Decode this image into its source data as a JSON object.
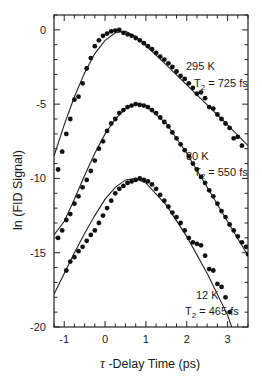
{
  "chart_data": {
    "type": "scatter",
    "title": "",
    "xlabel": "τ -Delay Time (ps)",
    "ylabel": "ln (FID Signal)",
    "xlim": [
      -1.25,
      3.5
    ],
    "ylim": [
      -20,
      1
    ],
    "xticks": [
      -1,
      0,
      1,
      2,
      3
    ],
    "yticks": [
      0,
      -5,
      -10,
      -15,
      -20
    ],
    "grid": false,
    "legend": "none",
    "series": [
      {
        "name": "295 K",
        "annotation": "295 K",
        "t2_label": "T2 = 725 fs",
        "t2_fs": 725,
        "offset": 0,
        "points": [
          [
            -1.15,
            -9.4
          ],
          [
            -1.05,
            -8.2
          ],
          [
            -0.95,
            -7.0
          ],
          [
            -0.85,
            -6.0
          ],
          [
            -0.75,
            -4.7
          ],
          [
            -0.65,
            -4.5
          ],
          [
            -0.55,
            -3.6
          ],
          [
            -0.45,
            -2.6
          ],
          [
            -0.35,
            -1.9
          ],
          [
            -0.25,
            -1.1
          ],
          [
            -0.15,
            -0.7
          ],
          [
            -0.05,
            -0.4
          ],
          [
            0.05,
            -0.25
          ],
          [
            0.15,
            -0.1
          ],
          [
            0.25,
            -0.05
          ],
          [
            0.35,
            0.0
          ],
          [
            0.45,
            -0.2
          ],
          [
            0.55,
            -0.3
          ],
          [
            0.65,
            -0.4
          ],
          [
            0.75,
            -0.55
          ],
          [
            0.85,
            -0.7
          ],
          [
            0.95,
            -0.9
          ],
          [
            1.05,
            -1.1
          ],
          [
            1.15,
            -1.3
          ],
          [
            1.25,
            -1.55
          ],
          [
            1.35,
            -1.8
          ],
          [
            1.45,
            -2.0
          ],
          [
            1.55,
            -2.25
          ],
          [
            1.65,
            -2.5
          ],
          [
            1.75,
            -2.8
          ],
          [
            1.85,
            -3.1
          ],
          [
            1.95,
            -3.3
          ],
          [
            2.05,
            -3.6
          ],
          [
            2.15,
            -3.9
          ],
          [
            2.25,
            -4.3
          ],
          [
            2.35,
            -4.2
          ],
          [
            2.45,
            -4.6
          ],
          [
            2.55,
            -5.2
          ],
          [
            2.65,
            -5.3
          ],
          [
            2.75,
            -5.7
          ],
          [
            2.85,
            -6.0
          ],
          [
            2.95,
            -6.3
          ],
          [
            3.05,
            -6.6
          ],
          [
            3.15,
            -7.3
          ],
          [
            3.25,
            -7.2
          ],
          [
            3.35,
            -7.8
          ]
        ],
        "fit": [
          [
            -1.25,
            -8.5
          ],
          [
            -1.0,
            -6.4
          ],
          [
            -0.75,
            -4.5
          ],
          [
            -0.5,
            -2.9
          ],
          [
            -0.25,
            -1.6
          ],
          [
            0.0,
            -0.7
          ],
          [
            0.25,
            -0.2
          ],
          [
            0.5,
            -0.1
          ],
          [
            0.75,
            -0.45
          ],
          [
            1.0,
            -1.05
          ],
          [
            1.5,
            -2.35
          ],
          [
            2.0,
            -3.7
          ],
          [
            2.5,
            -5.05
          ],
          [
            3.0,
            -6.4
          ],
          [
            3.5,
            -7.8
          ]
        ]
      },
      {
        "name": "80 K",
        "annotation": "80 K",
        "t2_label": "T2 = 550 fs",
        "t2_fs": 550,
        "offset": -5,
        "points": [
          [
            -1.15,
            -14.0
          ],
          [
            -1.05,
            -13.5
          ],
          [
            -0.95,
            -12.8
          ],
          [
            -0.85,
            -12.4
          ],
          [
            -0.75,
            -11.7
          ],
          [
            -0.65,
            -11.2
          ],
          [
            -0.55,
            -10.6
          ],
          [
            -0.45,
            -10.1
          ],
          [
            -0.35,
            -9.5
          ],
          [
            -0.25,
            -8.8
          ],
          [
            -0.15,
            -8.0
          ],
          [
            -0.05,
            -7.5
          ],
          [
            0.05,
            -6.8
          ],
          [
            0.15,
            -6.3
          ],
          [
            0.25,
            -6.0
          ],
          [
            0.35,
            -5.6
          ],
          [
            0.45,
            -5.4
          ],
          [
            0.55,
            -5.2
          ],
          [
            0.65,
            -5.1
          ],
          [
            0.75,
            -5.0
          ],
          [
            0.85,
            -5.05
          ],
          [
            0.95,
            -5.1
          ],
          [
            1.05,
            -5.2
          ],
          [
            1.15,
            -5.4
          ],
          [
            1.25,
            -5.6
          ],
          [
            1.35,
            -5.9
          ],
          [
            1.45,
            -6.2
          ],
          [
            1.55,
            -6.5
          ],
          [
            1.65,
            -6.9
          ],
          [
            1.75,
            -7.3
          ],
          [
            1.85,
            -7.7
          ],
          [
            1.95,
            -8.1
          ],
          [
            2.05,
            -8.5
          ],
          [
            2.15,
            -9.0
          ],
          [
            2.25,
            -9.4
          ],
          [
            2.35,
            -9.9
          ],
          [
            2.45,
            -10.3
          ],
          [
            2.55,
            -10.8
          ],
          [
            2.65,
            -11.2
          ],
          [
            2.75,
            -11.7
          ],
          [
            2.85,
            -12.2
          ],
          [
            2.95,
            -12.6
          ],
          [
            3.05,
            -13.1
          ],
          [
            3.15,
            -13.5
          ],
          [
            3.25,
            -13.9
          ],
          [
            3.35,
            -14.3
          ],
          [
            3.45,
            -14.6
          ],
          [
            3.5,
            -15.1
          ]
        ],
        "fit": [
          [
            -1.25,
            -13.8
          ],
          [
            -1.0,
            -12.9
          ],
          [
            -0.75,
            -11.4
          ],
          [
            -0.5,
            -9.8
          ],
          [
            -0.25,
            -8.3
          ],
          [
            0.0,
            -7.0
          ],
          [
            0.25,
            -6.0
          ],
          [
            0.5,
            -5.3
          ],
          [
            0.75,
            -5.0
          ],
          [
            1.0,
            -5.1
          ],
          [
            1.5,
            -6.3
          ],
          [
            2.0,
            -8.3
          ],
          [
            2.5,
            -10.6
          ],
          [
            3.0,
            -12.9
          ],
          [
            3.5,
            -15.2
          ]
        ]
      },
      {
        "name": "12 K",
        "annotation": "12 K",
        "t2_label": "T2 = 465 fs",
        "t2_fs": 465,
        "offset": -10,
        "points": [
          [
            -0.95,
            -16.2
          ],
          [
            -0.85,
            -15.6
          ],
          [
            -0.75,
            -15.3
          ],
          [
            -0.65,
            -14.9
          ],
          [
            -0.55,
            -14.6
          ],
          [
            -0.45,
            -14.2
          ],
          [
            -0.35,
            -13.8
          ],
          [
            -0.25,
            -13.5
          ],
          [
            -0.15,
            -13.0
          ],
          [
            -0.05,
            -12.5
          ],
          [
            0.05,
            -12.0
          ],
          [
            0.15,
            -11.5
          ],
          [
            0.25,
            -11.0
          ],
          [
            0.35,
            -10.7
          ],
          [
            0.45,
            -10.5
          ],
          [
            0.55,
            -10.3
          ],
          [
            0.65,
            -10.2
          ],
          [
            0.75,
            -10.1
          ],
          [
            0.85,
            -10.0
          ],
          [
            0.95,
            -10.1
          ],
          [
            1.05,
            -10.2
          ],
          [
            1.15,
            -10.4
          ],
          [
            1.25,
            -10.7
          ],
          [
            1.35,
            -11.1
          ],
          [
            1.45,
            -11.5
          ],
          [
            1.55,
            -11.9
          ],
          [
            1.65,
            -12.3
          ],
          [
            1.75,
            -12.6
          ],
          [
            1.85,
            -13.0
          ],
          [
            1.95,
            -13.5
          ],
          [
            2.05,
            -14.0
          ],
          [
            2.15,
            -14.3
          ],
          [
            2.25,
            -14.4
          ],
          [
            2.35,
            -14.5
          ],
          [
            2.45,
            -15.2
          ],
          [
            2.55,
            -16.1
          ],
          [
            2.65,
            -16.2
          ],
          [
            2.75,
            -17.1
          ],
          [
            2.85,
            -17.3
          ],
          [
            2.95,
            -18.0
          ],
          [
            3.05,
            -19.0
          ]
        ],
        "fit": [
          [
            -1.25,
            -17.8
          ],
          [
            -1.0,
            -16.4
          ],
          [
            -0.75,
            -15.0
          ],
          [
            -0.5,
            -13.7
          ],
          [
            -0.25,
            -12.5
          ],
          [
            0.0,
            -11.4
          ],
          [
            0.25,
            -10.6
          ],
          [
            0.5,
            -10.1
          ],
          [
            0.75,
            -10.0
          ],
          [
            1.0,
            -10.3
          ],
          [
            1.5,
            -11.8
          ],
          [
            2.0,
            -13.9
          ],
          [
            2.5,
            -16.4
          ],
          [
            3.0,
            -19.2
          ],
          [
            3.1,
            -20.0
          ]
        ]
      }
    ]
  }
}
